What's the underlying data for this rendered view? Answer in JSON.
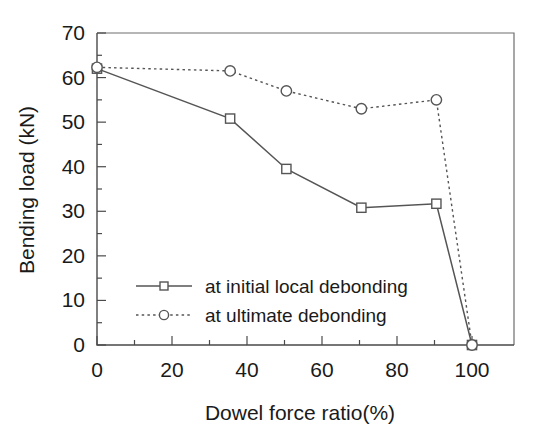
{
  "chart_data": {
    "type": "line",
    "title": "",
    "xlabel": "Dowel force ratio(%)",
    "ylabel": "Bending load (kN)",
    "xlim": [
      0,
      100
    ],
    "ylim": [
      0,
      70
    ],
    "xticks": [
      0,
      20,
      40,
      60,
      80,
      100
    ],
    "xtick_labels": [
      "0",
      "20",
      "40",
      "60",
      "80",
      "100"
    ],
    "yticks": [
      0,
      10,
      20,
      30,
      40,
      50,
      60,
      70
    ],
    "ytick_labels": [
      "0",
      "10",
      "20",
      "30",
      "40",
      "50",
      "60",
      "70"
    ],
    "minor_xtick_step": 10,
    "minor_ytick_step": 5,
    "grid": false,
    "legend_position": "lower-left-inside",
    "series": [
      {
        "name": "at initial local debonding",
        "marker": "square-open",
        "linestyle": "solid",
        "color": "#555555",
        "x": [
          0,
          35.5,
          50.5,
          70.5,
          90.5,
          100
        ],
        "values": [
          62.0,
          50.8,
          39.5,
          30.8,
          31.7,
          0.0
        ]
      },
      {
        "name": "at ultimate debonding",
        "marker": "circle-open",
        "linestyle": "dotted",
        "color": "#555555",
        "x": [
          0,
          35.5,
          50.5,
          70.5,
          90.5,
          100
        ],
        "values": [
          62.3,
          61.5,
          57.0,
          53.0,
          55.0,
          0.0
        ]
      }
    ]
  },
  "legend": {
    "entries": [
      {
        "label": "at initial local debonding",
        "style": "solid-square"
      },
      {
        "label": "at ultimate debonding",
        "style": "dotted-circle"
      }
    ]
  },
  "axes": {
    "x_title": "Dowel force ratio(%)",
    "y_title": "Bending load (kN)"
  }
}
